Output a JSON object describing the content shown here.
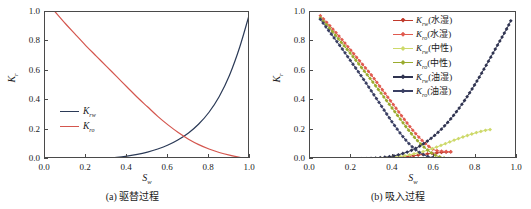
{
  "figure": {
    "panels": [
      {
        "id": "a",
        "caption": "(a) 驱替过程",
        "xlabel_base": "S",
        "xlabel_sub": "w",
        "ylabel_base": "K",
        "ylabel_sub": "r",
        "xticks": [
          "0.0",
          "0.2",
          "0.4",
          "0.6",
          "0.8",
          "1.0"
        ],
        "yticks": [
          "0.0",
          "0.2",
          "0.4",
          "0.6",
          "0.8",
          "1.0"
        ],
        "legend": [
          {
            "base": "K",
            "sub": "rw",
            "suffix": "",
            "color": "#2b3a57"
          },
          {
            "base": "K",
            "sub": "ro",
            "suffix": "",
            "color": "#d4564e"
          }
        ]
      },
      {
        "id": "b",
        "caption": "(b) 吸入过程",
        "xlabel_base": "S",
        "xlabel_sub": "w",
        "ylabel_base": "K",
        "ylabel_sub": "r",
        "xticks": [
          "0.0",
          "0.2",
          "0.4",
          "0.6",
          "0.8",
          "1.0"
        ],
        "yticks": [
          "0.0",
          "0.2",
          "0.4",
          "0.6",
          "0.8",
          "1.0"
        ],
        "legend": [
          {
            "base": "K",
            "sub": "rw",
            "suffix": "(水湿)",
            "color": "#c0392b"
          },
          {
            "base": "K",
            "sub": "ro",
            "suffix": "(水湿)",
            "color": "#e05a4f"
          },
          {
            "base": "K",
            "sub": "rw",
            "suffix": "(中性)",
            "color": "#cdd96a"
          },
          {
            "base": "K",
            "sub": "ro",
            "suffix": "(中性)",
            "color": "#9aab2e"
          },
          {
            "base": "K",
            "sub": "rw",
            "suffix": "(油湿)",
            "color": "#2f3350"
          },
          {
            "base": "K",
            "sub": "ro",
            "suffix": "(油湿)",
            "color": "#3a3f63"
          }
        ]
      }
    ]
  },
  "chart_data": [
    {
      "type": "line",
      "panel": "a",
      "title": "(a) 驱替过程",
      "xlabel": "Sw",
      "ylabel": "Kr",
      "xlim": [
        0.0,
        1.0
      ],
      "ylim": [
        0.0,
        1.0
      ],
      "grid": false,
      "legend_position": "inner-left-lower",
      "series": [
        {
          "name": "Krw",
          "color": "#2b3a57",
          "x": [
            0.05,
            0.1,
            0.15,
            0.2,
            0.25,
            0.3,
            0.35,
            0.4,
            0.45,
            0.5,
            0.55,
            0.6,
            0.65,
            0.7,
            0.75,
            0.8,
            0.85,
            0.9,
            0.95,
            1.0
          ],
          "y": [
            0.0,
            0.0,
            0.001,
            0.002,
            0.004,
            0.007,
            0.012,
            0.02,
            0.031,
            0.047,
            0.068,
            0.095,
            0.131,
            0.177,
            0.238,
            0.318,
            0.425,
            0.57,
            0.762,
            1.0
          ]
        },
        {
          "name": "Kro",
          "color": "#d4564e",
          "x": [
            0.05,
            0.1,
            0.15,
            0.2,
            0.25,
            0.3,
            0.35,
            0.4,
            0.45,
            0.5,
            0.55,
            0.6,
            0.65,
            0.7,
            0.75,
            0.8,
            0.85,
            0.9,
            0.95,
            1.0
          ],
          "y": [
            1.0,
            0.92,
            0.845,
            0.77,
            0.7,
            0.63,
            0.56,
            0.49,
            0.42,
            0.355,
            0.29,
            0.232,
            0.18,
            0.135,
            0.098,
            0.068,
            0.044,
            0.026,
            0.012,
            0.003
          ]
        }
      ]
    },
    {
      "type": "line",
      "panel": "b",
      "title": "(b) 吸入过程",
      "xlabel": "Sw",
      "ylabel": "Kr",
      "xlim": [
        0.0,
        1.0
      ],
      "ylim": [
        0.0,
        1.0
      ],
      "grid": false,
      "legend_position": "inner-top-right",
      "marker": "diamond",
      "series": [
        {
          "name": "Krw(水湿)",
          "color": "#c0392b",
          "x": [
            0.05,
            0.1,
            0.15,
            0.2,
            0.25,
            0.3,
            0.35,
            0.4,
            0.45,
            0.5,
            0.55,
            0.6,
            0.65,
            0.68
          ],
          "y": [
            0.0,
            0.0,
            0.0,
            0.0,
            0.0,
            0.0,
            0.002,
            0.006,
            0.013,
            0.022,
            0.032,
            0.04,
            0.046,
            0.048
          ]
        },
        {
          "name": "Kro(水湿)",
          "color": "#e05a4f",
          "x": [
            0.05,
            0.1,
            0.15,
            0.2,
            0.25,
            0.3,
            0.35,
            0.4,
            0.45,
            0.5,
            0.55,
            0.6,
            0.65,
            0.68
          ],
          "y": [
            0.975,
            0.9,
            0.82,
            0.735,
            0.65,
            0.565,
            0.47,
            0.375,
            0.28,
            0.19,
            0.115,
            0.062,
            0.052,
            0.05
          ]
        },
        {
          "name": "Krw(中性)",
          "color": "#cdd96a",
          "x": [
            0.05,
            0.1,
            0.15,
            0.2,
            0.25,
            0.3,
            0.35,
            0.4,
            0.45,
            0.5,
            0.55,
            0.6,
            0.65,
            0.7,
            0.75,
            0.8,
            0.85,
            0.87
          ],
          "y": [
            0.0,
            0.0,
            0.0,
            0.0,
            0.0,
            0.001,
            0.004,
            0.01,
            0.02,
            0.034,
            0.052,
            0.075,
            0.102,
            0.13,
            0.155,
            0.178,
            0.196,
            0.2
          ]
        },
        {
          "name": "Kro(中性)",
          "color": "#9aab2e",
          "x": [
            0.05,
            0.1,
            0.15,
            0.2,
            0.25,
            0.3,
            0.35,
            0.4,
            0.45,
            0.5,
            0.55,
            0.6,
            0.65,
            0.7,
            0.75,
            0.8,
            0.85,
            0.87
          ],
          "y": [
            0.96,
            0.88,
            0.795,
            0.71,
            0.62,
            0.53,
            0.435,
            0.34,
            0.245,
            0.155,
            0.082,
            0.03,
            0.006,
            0.001,
            0.0,
            0.0,
            0.0,
            0.0
          ]
        },
        {
          "name": "Krw(油湿)",
          "color": "#2f3350",
          "x": [
            0.05,
            0.1,
            0.15,
            0.2,
            0.25,
            0.3,
            0.35,
            0.4,
            0.45,
            0.5,
            0.55,
            0.6,
            0.65,
            0.7,
            0.75,
            0.8,
            0.85,
            0.9,
            0.95,
            0.97
          ],
          "y": [
            0.0,
            0.0,
            0.0,
            0.001,
            0.002,
            0.005,
            0.01,
            0.02,
            0.038,
            0.065,
            0.105,
            0.158,
            0.225,
            0.308,
            0.405,
            0.515,
            0.635,
            0.76,
            0.885,
            0.94
          ]
        },
        {
          "name": "Kro(油湿)",
          "color": "#3a3f63",
          "x": [
            0.05,
            0.1,
            0.15,
            0.2,
            0.25,
            0.3,
            0.35,
            0.4,
            0.45,
            0.5,
            0.55,
            0.6,
            0.65,
            0.7,
            0.75,
            0.8,
            0.85,
            0.9,
            0.95,
            0.97
          ],
          "y": [
            0.95,
            0.855,
            0.76,
            0.66,
            0.56,
            0.455,
            0.35,
            0.245,
            0.15,
            0.075,
            0.028,
            0.006,
            0.001,
            0.0,
            0.0,
            0.0,
            0.0,
            0.0,
            0.0,
            0.0
          ]
        }
      ]
    }
  ]
}
